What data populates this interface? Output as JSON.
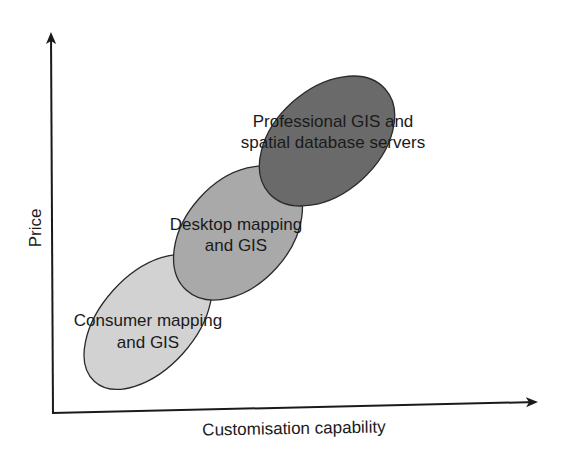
{
  "diagram": {
    "axes": {
      "x_label": "Customisation capability",
      "y_label": "Price"
    },
    "segments": [
      {
        "line1": "Consumer mapping",
        "line2": "and GIS",
        "fill": "#d2d2d2"
      },
      {
        "line1": "Desktop mapping",
        "line2": "and GIS",
        "fill": "#a9a9a9"
      },
      {
        "line1": "Professional GIS and",
        "line2": "spatial database servers",
        "fill": "#6a6a6a"
      }
    ],
    "colors": {
      "axis": "#1a1a1a",
      "outline": "#2a2a2a",
      "background": "#ffffff"
    }
  }
}
